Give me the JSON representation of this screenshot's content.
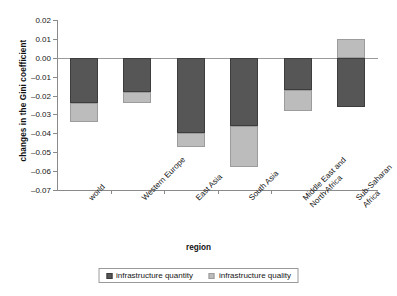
{
  "chart_data": {
    "type": "bar",
    "title": "",
    "xlabel": "region",
    "ylabel": "changes in the Gini coefficient",
    "ylim": [
      -0.07,
      0.02
    ],
    "ytick_step": 0.01,
    "ytick_labels": [
      "0.02",
      "0.01",
      "0.00",
      "-0.01",
      "-0.02",
      "-0.03",
      "-0.04",
      "-0.05",
      "-0.06",
      "-0.07"
    ],
    "ytick_values": [
      0.02,
      0.01,
      0.0,
      -0.01,
      -0.02,
      -0.03,
      -0.04,
      -0.05,
      -0.06,
      -0.07
    ],
    "grid": false,
    "stacked": true,
    "legend_position": "bottom",
    "categories": [
      "world",
      "Western Europe",
      "East Asia",
      "South Asia",
      "Middle East and North Africa",
      "Sub-Saharan Africa"
    ],
    "category_lines": [
      [
        "world"
      ],
      [
        "Western Europe"
      ],
      [
        "East Asia"
      ],
      [
        "South Asia"
      ],
      [
        "Middle East and",
        "North Africa"
      ],
      [
        "Sub-Saharan",
        "Africa"
      ]
    ],
    "series": [
      {
        "name": "infrastructure quantity",
        "color": "#565656",
        "values": [
          -0.024,
          -0.018,
          -0.04,
          -0.036,
          -0.017,
          -0.026
        ]
      },
      {
        "name": "infrastructure quality",
        "color": "#bcbcbc",
        "values": [
          -0.01,
          -0.006,
          -0.007,
          -0.022,
          -0.011,
          0.01
        ]
      }
    ],
    "stack_totals": [
      -0.034,
      -0.024,
      -0.047,
      -0.058,
      -0.028,
      -0.016
    ]
  },
  "legend": {
    "items": [
      {
        "label": "infrastructure quantity",
        "swatch": "dark-gray-swatch"
      },
      {
        "label": "infrastructure quality",
        "swatch": "light-gray-swatch"
      }
    ]
  },
  "axes": {
    "y_title": "changes in the Gini coefficient",
    "x_title": "region"
  }
}
